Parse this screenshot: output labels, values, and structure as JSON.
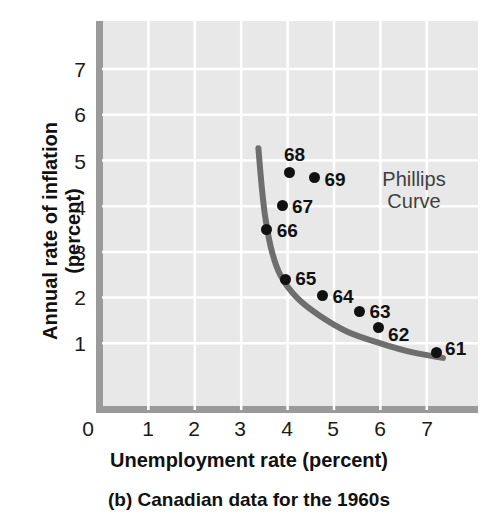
{
  "figure": {
    "caption": "(b) Canadian data for the 1960s",
    "annotation_line1": "Phillips",
    "annotation_line2": "Curve",
    "axis_color": "#9a9a9a",
    "plot_bg": "#e8e8e8",
    "grid_color": "#ffffff",
    "curve_color": "#6e6e6e",
    "point_color": "#111111"
  },
  "chart_data": {
    "type": "scatter",
    "title": "(b) Canadian data for the 1960s",
    "xlabel": "Unemployment rate (percent)",
    "ylabel_line1": "Annual rate of inflation",
    "ylabel_line2": "(percent)",
    "xlim": [
      0,
      7.8
    ],
    "ylim": [
      0,
      7.8
    ],
    "xticks": [
      "0",
      "1",
      "2",
      "3",
      "4",
      "5",
      "6",
      "7"
    ],
    "yticks": [
      "1",
      "2",
      "3",
      "4",
      "5",
      "6",
      "7"
    ],
    "grid": true,
    "legend": "none",
    "annotations": [
      {
        "text": "Phillips Curve",
        "x": 5.9,
        "y": 4.6
      }
    ],
    "points": [
      {
        "label": "61",
        "x": 7.2,
        "y": 0.8,
        "label_dx": 9,
        "label_dy": -9
      },
      {
        "label": "62",
        "x": 5.95,
        "y": 1.35,
        "label_dx": 10,
        "label_dy": 2
      },
      {
        "label": "63",
        "x": 5.55,
        "y": 1.7,
        "label_dx": 10,
        "label_dy": -5
      },
      {
        "label": "64",
        "x": 4.75,
        "y": 2.05,
        "label_dx": 10,
        "label_dy": -4
      },
      {
        "label": "65",
        "x": 3.95,
        "y": 2.4,
        "label_dx": 10,
        "label_dy": -6
      },
      {
        "label": "66",
        "x": 3.55,
        "y": 3.5,
        "label_dx": 10,
        "label_dy": -4
      },
      {
        "label": "67",
        "x": 3.88,
        "y": 4.02,
        "label_dx": 10,
        "label_dy": -4
      },
      {
        "label": "68",
        "x": 4.05,
        "y": 4.73,
        "label_dx": -6,
        "label_dy": -24
      },
      {
        "label": "69",
        "x": 4.58,
        "y": 4.62,
        "label_dx": 10,
        "label_dy": -4
      }
    ],
    "curve": {
      "name": "Phillips Curve",
      "description": "Downward-sloping convex curve fitted through the 1960s points",
      "points": [
        {
          "x": 3.37,
          "y": 5.27
        },
        {
          "x": 3.44,
          "y": 4.45
        },
        {
          "x": 3.52,
          "y": 3.75
        },
        {
          "x": 3.65,
          "y": 3.05
        },
        {
          "x": 3.85,
          "y": 2.48
        },
        {
          "x": 4.2,
          "y": 2.0
        },
        {
          "x": 4.7,
          "y": 1.6
        },
        {
          "x": 5.3,
          "y": 1.25
        },
        {
          "x": 6.0,
          "y": 1.0
        },
        {
          "x": 6.7,
          "y": 0.8
        },
        {
          "x": 7.35,
          "y": 0.68
        }
      ]
    }
  }
}
